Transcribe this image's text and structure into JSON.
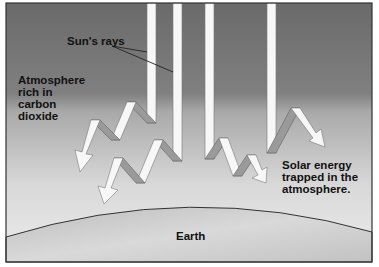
{
  "diagram": {
    "labels": {
      "sun_rays": "Sun's rays",
      "atmosphere": "Atmosphere\nrich in\ncarbon\ndioxide",
      "solar_energy": "Solar energy\ntrapped in the\natmosphere.",
      "earth": "Earth"
    },
    "colors": {
      "sky_top": "#6e6e6e",
      "sky_bottom": "#e8e8e8",
      "earth_fill": "#c4c4c4",
      "ray_fill": "#f7f7f7",
      "ray_shade": "#9a9a9a",
      "frame": "#333333"
    },
    "components": [
      "frame",
      "sky-gradient",
      "earth-surface",
      "sun-ray-1",
      "sun-ray-2",
      "sun-ray-3",
      "sun-ray-4",
      "zigzag-reflected-ray-left-upper",
      "zigzag-reflected-ray-left-lower",
      "zigzag-reflected-ray-right-center",
      "zigzag-reflected-ray-right"
    ]
  }
}
